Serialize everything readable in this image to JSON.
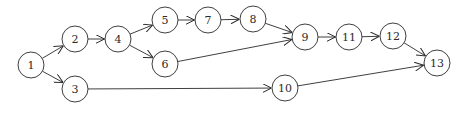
{
  "diagram": {
    "type": "directed-network",
    "node_radius": 13,
    "colors": {
      "stroke": "#2a2a2a",
      "fill": "#ffffff",
      "background": "#ffffff"
    },
    "nodes": [
      {
        "id": "1",
        "label": "1",
        "x": 31,
        "y": 65
      },
      {
        "id": "2",
        "label": "2",
        "x": 75,
        "y": 39
      },
      {
        "id": "3",
        "label": "3",
        "x": 75,
        "y": 89
      },
      {
        "id": "4",
        "label": "4",
        "x": 118,
        "y": 39
      },
      {
        "id": "5",
        "label": "5",
        "x": 165,
        "y": 20
      },
      {
        "id": "6",
        "label": "6",
        "x": 165,
        "y": 64
      },
      {
        "id": "7",
        "label": "7",
        "x": 208,
        "y": 20
      },
      {
        "id": "8",
        "label": "8",
        "x": 253,
        "y": 19
      },
      {
        "id": "9",
        "label": "9",
        "x": 305,
        "y": 37
      },
      {
        "id": "10",
        "label": "10",
        "x": 285,
        "y": 88
      },
      {
        "id": "11",
        "label": "11",
        "x": 349,
        "y": 37
      },
      {
        "id": "12",
        "label": "12",
        "x": 393,
        "y": 36
      },
      {
        "id": "13",
        "label": "13",
        "x": 437,
        "y": 63
      }
    ],
    "edges": [
      {
        "from": "1",
        "to": "2"
      },
      {
        "from": "1",
        "to": "3"
      },
      {
        "from": "2",
        "to": "4"
      },
      {
        "from": "4",
        "to": "5"
      },
      {
        "from": "4",
        "to": "6"
      },
      {
        "from": "5",
        "to": "7"
      },
      {
        "from": "7",
        "to": "8"
      },
      {
        "from": "8",
        "to": "9"
      },
      {
        "from": "6",
        "to": "9"
      },
      {
        "from": "3",
        "to": "10"
      },
      {
        "from": "9",
        "to": "11"
      },
      {
        "from": "11",
        "to": "12"
      },
      {
        "from": "12",
        "to": "13"
      },
      {
        "from": "10",
        "to": "13"
      }
    ]
  }
}
